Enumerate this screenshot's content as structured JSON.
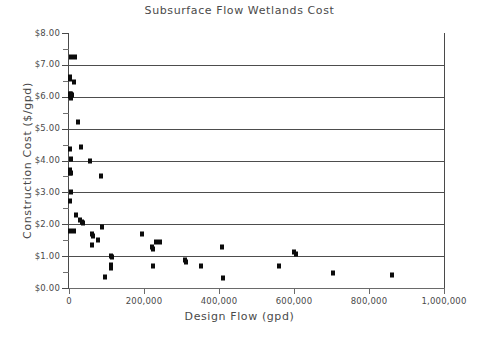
{
  "chart": {
    "title": "Subsurface Flow Wetlands Cost",
    "xlabel": "Design Flow (gpd)",
    "ylabel": "Construction Cost ($/gpd)"
  },
  "axes": {
    "y_ticks": [
      "$0.00",
      "$1.00",
      "$2.00",
      "$3.00",
      "$4.00",
      "$5.00",
      "$6.00",
      "$7.00",
      "$8.00"
    ],
    "x_ticks": [
      "0",
      "200,000",
      "400,000",
      "600,000",
      "800,000",
      "1,000,000"
    ]
  },
  "chart_data": {
    "type": "scatter",
    "title": "Subsurface Flow Wetlands Cost",
    "xlabel": "Design Flow (gpd)",
    "ylabel": "Construction Cost ($/gpd)",
    "xlim": [
      0,
      1000000
    ],
    "ylim": [
      0,
      8
    ],
    "xticks": [
      0,
      200000,
      400000,
      600000,
      800000,
      1000000
    ],
    "yticks": [
      0,
      1,
      2,
      3,
      4,
      5,
      6,
      7,
      8
    ],
    "grid": "horizontal",
    "legend": null,
    "marker": "square",
    "marker_color": "#0b0b0b",
    "series": [
      {
        "name": "Subsurface flow wetlands",
        "points": [
          [
            4000,
            7.25
          ],
          [
            17000,
            7.25
          ],
          [
            3000,
            6.62
          ],
          [
            3000,
            6.55
          ],
          [
            14000,
            6.45
          ],
          [
            3000,
            6.1
          ],
          [
            5000,
            6.08
          ],
          [
            3000,
            6.02
          ],
          [
            4000,
            5.98
          ],
          [
            6000,
            5.95
          ],
          [
            8000,
            6.05
          ],
          [
            25000,
            5.22
          ],
          [
            33000,
            4.42
          ],
          [
            2000,
            4.35
          ],
          [
            4000,
            4.05
          ],
          [
            55000,
            3.98
          ],
          [
            2000,
            3.7
          ],
          [
            3000,
            3.62
          ],
          [
            4000,
            3.6
          ],
          [
            85000,
            3.5
          ],
          [
            4000,
            3.02
          ],
          [
            3000,
            2.72
          ],
          [
            19000,
            2.3
          ],
          [
            29000,
            2.12
          ],
          [
            35000,
            2.08
          ],
          [
            38000,
            2.04
          ],
          [
            2000,
            1.8
          ],
          [
            14000,
            1.78
          ],
          [
            88000,
            1.9
          ],
          [
            62000,
            1.68
          ],
          [
            64000,
            1.62
          ],
          [
            62000,
            1.35
          ],
          [
            76000,
            1.5
          ],
          [
            195000,
            1.68
          ],
          [
            232000,
            1.45
          ],
          [
            243000,
            1.43
          ],
          [
            222000,
            1.28
          ],
          [
            224000,
            1.22
          ],
          [
            408000,
            1.3
          ],
          [
            600000,
            1.12
          ],
          [
            604000,
            1.08
          ],
          [
            113000,
            1.0
          ],
          [
            114000,
            0.96
          ],
          [
            309000,
            0.88
          ],
          [
            312000,
            0.82
          ],
          [
            113000,
            0.72
          ],
          [
            112000,
            0.64
          ],
          [
            225000,
            0.7
          ],
          [
            352000,
            0.7
          ],
          [
            561000,
            0.68
          ],
          [
            704000,
            0.46
          ],
          [
            862000,
            0.41
          ],
          [
            95000,
            0.35
          ],
          [
            410000,
            0.3
          ]
        ]
      }
    ]
  }
}
